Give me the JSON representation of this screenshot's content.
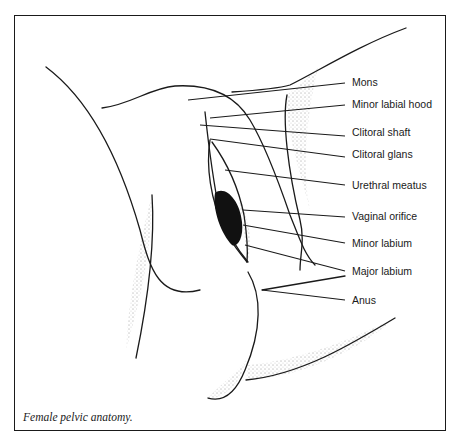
{
  "figure": {
    "caption": "Female pelvic anatomy.",
    "labels": [
      {
        "id": "mons",
        "text": "Mons",
        "y": 82
      },
      {
        "id": "minor-labial-hood",
        "text": "Minor labial hood",
        "y": 104
      },
      {
        "id": "clitoral-shaft",
        "text": "Clitoral shaft",
        "y": 131
      },
      {
        "id": "clitoral-glans",
        "text": "Clitoral glans",
        "y": 152
      },
      {
        "id": "urethral-meatus",
        "text": "Urethral meatus",
        "y": 180
      },
      {
        "id": "vaginal-orifice",
        "text": "Vaginal orifice",
        "y": 212
      },
      {
        "id": "minor-labium",
        "text": "Minor labium",
        "y": 238
      },
      {
        "id": "major-labium",
        "text": "Major labium",
        "y": 266
      },
      {
        "id": "anus",
        "text": "Anus",
        "y": 296
      }
    ]
  }
}
